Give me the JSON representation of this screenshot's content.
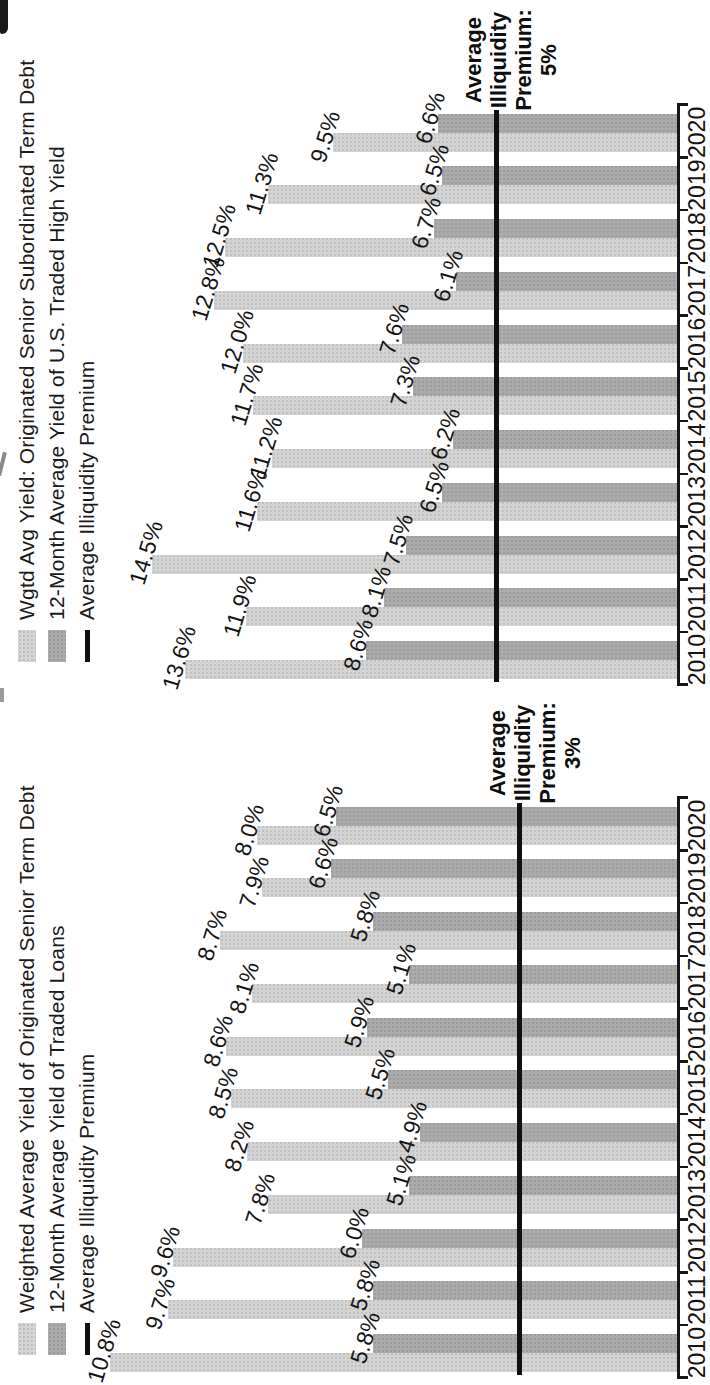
{
  "figure": {
    "orientation": "rotated-90-ccw",
    "background": "#ffffff",
    "text_color": "#1b1b1b"
  },
  "chart_data": [
    {
      "type": "bar",
      "title": "",
      "categories": [
        "2010",
        "2011",
        "2012",
        "2013",
        "2014",
        "2015",
        "2016",
        "2017",
        "2018",
        "2019",
        "2020"
      ],
      "series": [
        {
          "name": "Weighted Average Yield of Originated Senior Term Debt",
          "color": "#d4d4d4",
          "values": [
            10.8,
            9.7,
            9.6,
            7.8,
            8.2,
            8.5,
            8.6,
            8.1,
            8.7,
            7.9,
            8.0
          ]
        },
        {
          "name": "12-Month Average Yield of Traded Loans",
          "color": "#ababab",
          "values": [
            5.8,
            5.8,
            6.0,
            5.1,
            4.9,
            5.5,
            5.9,
            5.1,
            5.8,
            6.6,
            6.5
          ]
        }
      ],
      "line_series": {
        "name": "Average Illiquidity Premium",
        "value": 3,
        "color": "#101010"
      },
      "annotation": [
        "Average",
        "Illiquidity",
        "Premium:",
        "3%"
      ],
      "value_label_format": "one-decimal-percent",
      "px_per_pct": 52.5,
      "ylim": [
        0,
        12.8
      ],
      "grid": false,
      "legend_position": "top-left"
    },
    {
      "type": "bar",
      "title": "",
      "categories": [
        "2010",
        "2011",
        "2012",
        "2013",
        "2014",
        "2015",
        "2016",
        "2017",
        "2018",
        "2019",
        "2020"
      ],
      "series": [
        {
          "name": "Wgtd Avg Yield: Originated Senior Subordinated Term Debt",
          "color": "#d4d4d4",
          "values": [
            13.6,
            11.9,
            14.5,
            11.6,
            11.2,
            11.7,
            12.0,
            12.8,
            12.5,
            11.3,
            9.5
          ]
        },
        {
          "name": "12-Month Average Yield of U.S. Traded High Yield",
          "color": "#ababab",
          "values": [
            8.6,
            8.1,
            7.5,
            6.5,
            6.2,
            7.3,
            7.6,
            6.1,
            6.7,
            6.5,
            6.6
          ]
        }
      ],
      "line_series": {
        "name": "Average Illiquidity Premium",
        "value": 5,
        "color": "#101010"
      },
      "annotation": [
        "Average",
        "Illiquidity",
        "Premium:",
        "5%"
      ],
      "value_label_format": "one-decimal-percent",
      "px_per_pct": 36.2,
      "ylim": [
        0,
        18.5
      ],
      "grid": false,
      "legend_position": "top-left"
    }
  ]
}
